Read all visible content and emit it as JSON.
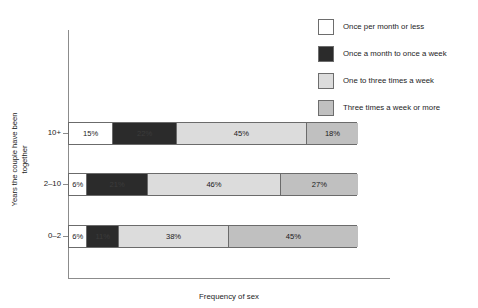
{
  "chart_data": {
    "type": "bar",
    "orientation": "horizontal",
    "stacked": true,
    "stacked_mode": "percent",
    "title": "",
    "xlabel": "Frequency of sex",
    "ylabel": "Years the couple have been together",
    "categories": [
      "10+",
      "2–10",
      "0–2"
    ],
    "xlim": [
      0,
      100
    ],
    "grid": false,
    "legend_position": "top-right",
    "series": [
      {
        "name": "Once per month or less",
        "color": "#ffffff",
        "values": [
          15,
          6,
          6
        ],
        "labels": [
          "15%",
          "6%",
          "6%"
        ]
      },
      {
        "name": "Once a month to once a week",
        "color": "#2b2b2b",
        "values": [
          22,
          21,
          11
        ],
        "labels": [
          "22%",
          "21%",
          "11%"
        ]
      },
      {
        "name": "One to three times a week",
        "color": "#dcdcdc",
        "values": [
          45,
          46,
          38
        ],
        "labels": [
          "45%",
          "46%",
          "38%"
        ]
      },
      {
        "name": "Three times a week or more",
        "color": "#c0c0c0",
        "values": [
          18,
          27,
          45
        ],
        "labels": [
          "18%",
          "27%",
          "45%"
        ]
      }
    ]
  },
  "legend": {
    "items": [
      {
        "label": "Once per month or less",
        "color": "#ffffff"
      },
      {
        "label": "Once a month to once a week",
        "color": "#2b2b2b"
      },
      {
        "label": "One to three times a week",
        "color": "#dcdcdc"
      },
      {
        "label": "Three times a week or more",
        "color": "#c0c0c0"
      }
    ]
  },
  "axes": {
    "y_title": "Years the couple have been together",
    "x_title": "Frequency of sex",
    "y_ticks": [
      "10+",
      "2–10",
      "0–2"
    ]
  },
  "rows": [
    {
      "category": "10+",
      "top": 122,
      "segments": [
        {
          "series": "Once per month or less",
          "value": 15,
          "label": "15%"
        },
        {
          "series": "Once a month to once a week",
          "value": 22,
          "label": "22%"
        },
        {
          "series": "One to three times a week",
          "value": 45,
          "label": "45%"
        },
        {
          "series": "Three times a week or more",
          "value": 18,
          "label": "18%"
        }
      ]
    },
    {
      "category": "2–10",
      "top": 173,
      "segments": [
        {
          "series": "Once per month or less",
          "value": 6,
          "label": "6%"
        },
        {
          "series": "Once a month to once a week",
          "value": 21,
          "label": "21%"
        },
        {
          "series": "One to three times a week",
          "value": 46,
          "label": "46%"
        },
        {
          "series": "Three times a week or more",
          "value": 27,
          "label": "27%"
        }
      ]
    },
    {
      "category": "0–2",
      "top": 225,
      "segments": [
        {
          "series": "Once per month or less",
          "value": 6,
          "label": "6%"
        },
        {
          "series": "Once a month to once a week",
          "value": 11,
          "label": "11%"
        },
        {
          "series": "One to three times a week",
          "value": 38,
          "label": "38%"
        },
        {
          "series": "Three times a week or more",
          "value": 45,
          "label": "45%"
        }
      ]
    }
  ]
}
